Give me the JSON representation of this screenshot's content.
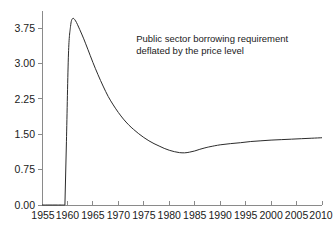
{
  "chart_data": {
    "type": "line",
    "title": "",
    "subtitle": "",
    "xlabel": "",
    "ylabel": "",
    "xlim": [
      1955,
      2010
    ],
    "ylim": [
      0.0,
      4.2
    ],
    "grid": false,
    "legend": null,
    "annotations": [
      {
        "name": "series-annotation",
        "line1": "Public sector borrowing requirement",
        "line2": "deflated by the price level",
        "x": 1973.5,
        "y": 3.45
      }
    ],
    "xticks": [
      1955,
      1960,
      1965,
      1970,
      1975,
      1980,
      1985,
      1990,
      1995,
      2000,
      2005,
      2010
    ],
    "xtick_labels": [
      "1955",
      "1960",
      "1965",
      "1970",
      "1975",
      "1980",
      "1985",
      "1990",
      "1995",
      "2000",
      "2005",
      "2010"
    ],
    "yticks": [
      0.0,
      0.75,
      1.5,
      2.25,
      3.0,
      3.75
    ],
    "ytick_labels": [
      "0.00",
      "0.75",
      "1.50",
      "2.25",
      "3.00",
      "3.75"
    ],
    "series": [
      {
        "name": "Public sector borrowing requirement deflated by the price level",
        "color": "#2b2b2b",
        "x": [
          1955.0,
          1956.0,
          1957.0,
          1958.0,
          1959.0,
          1959.4,
          1959.5,
          1959.8,
          1960.2,
          1960.6,
          1961.0,
          1961.6,
          1962.4,
          1963.2,
          1964.0,
          1965.0,
          1966.0,
          1967.0,
          1968.0,
          1969.0,
          1970.0,
          1971.0,
          1972.0,
          1973.0,
          1974.0,
          1975.0,
          1976.0,
          1977.0,
          1978.0,
          1979.0,
          1980.0,
          1981.0,
          1982.0,
          1983.0,
          1984.0,
          1985.0,
          1986.0,
          1987.0,
          1988.0,
          1990.0,
          1992.0,
          1994.0,
          1996.0,
          1998.0,
          2000.0,
          2002.0,
          2004.0,
          2006.0,
          2008.0,
          2010.0
        ],
        "y": [
          0.0,
          0.0,
          0.0,
          0.0,
          0.0,
          0.0,
          0.0,
          1.35,
          3.2,
          3.78,
          3.95,
          3.9,
          3.72,
          3.52,
          3.3,
          3.02,
          2.76,
          2.52,
          2.3,
          2.12,
          1.96,
          1.82,
          1.7,
          1.6,
          1.51,
          1.43,
          1.36,
          1.3,
          1.25,
          1.2,
          1.16,
          1.13,
          1.11,
          1.105,
          1.12,
          1.145,
          1.18,
          1.21,
          1.235,
          1.275,
          1.3,
          1.32,
          1.345,
          1.36,
          1.375,
          1.385,
          1.395,
          1.405,
          1.415,
          1.425
        ]
      }
    ]
  },
  "axes": {
    "axis_color": "#8a8a8a",
    "text_color": "#1a1a1a",
    "background": "#ffffff"
  }
}
